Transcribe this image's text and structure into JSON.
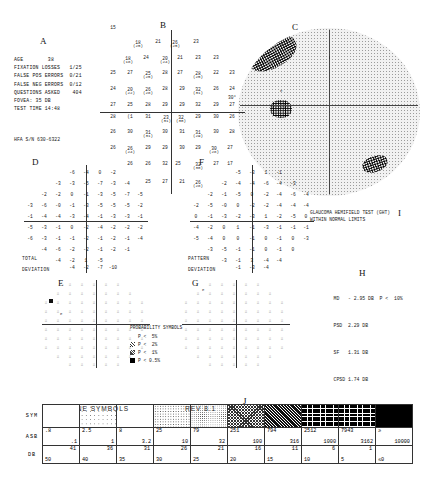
{
  "sections": {
    "A": "A",
    "B": "B",
    "C": "C",
    "D": "D",
    "E": "E",
    "F": "F",
    "G": "G",
    "H": "H",
    "I": "I",
    "J": "J"
  },
  "info": {
    "lines": [
      "AGE        38",
      "FIXATION LOSSES   1/25",
      "FALSE POS ERRORS  0/21",
      "FALSE NEG ERRORS  0/12",
      "QUESTIONS ASKED    404",
      "FOVEA: 35 DB",
      "TEST TIME 14:48"
    ],
    "serial": "HFA S/N  630-6322"
  },
  "raw_sensitivity": {
    "label_deg": "30°",
    "cells": [
      {
        "x": 113,
        "y": 27,
        "v": "15",
        "p": ""
      },
      {
        "x": 138,
        "y": 44,
        "v": "18",
        "p": "(25)"
      },
      {
        "x": 158,
        "y": 41,
        "v": "21",
        "p": ""
      },
      {
        "x": 175,
        "y": 44,
        "v": "26",
        "p": "(25)"
      },
      {
        "x": 196,
        "y": 41,
        "v": "23",
        "p": ""
      },
      {
        "x": 128,
        "y": 60,
        "v": "18",
        "p": "(18)"
      },
      {
        "x": 146,
        "y": 57,
        "v": "24",
        "p": ""
      },
      {
        "x": 165,
        "y": 60,
        "v": "20",
        "p": "(24)"
      },
      {
        "x": 180,
        "y": 57,
        "v": "21",
        "p": ""
      },
      {
        "x": 198,
        "y": 57,
        "v": "23",
        "p": ""
      },
      {
        "x": 216,
        "y": 57,
        "v": "23",
        "p": ""
      },
      {
        "x": 113,
        "y": 72,
        "v": "25",
        "p": ""
      },
      {
        "x": 130,
        "y": 72,
        "v": "27",
        "p": ""
      },
      {
        "x": 148,
        "y": 75,
        "v": "25",
        "p": "(25)"
      },
      {
        "x": 165,
        "y": 72,
        "v": "28",
        "p": ""
      },
      {
        "x": 180,
        "y": 72,
        "v": "27",
        "p": ""
      },
      {
        "x": 198,
        "y": 75,
        "v": "28",
        "p": "(25)"
      },
      {
        "x": 216,
        "y": 72,
        "v": "22",
        "p": ""
      },
      {
        "x": 232,
        "y": 72,
        "v": "23",
        "p": ""
      },
      {
        "x": 113,
        "y": 88,
        "v": "24",
        "p": ""
      },
      {
        "x": 130,
        "y": 91,
        "v": "20",
        "p": "(22)"
      },
      {
        "x": 148,
        "y": 91,
        "v": "26",
        "p": "(28)"
      },
      {
        "x": 165,
        "y": 88,
        "v": "28",
        "p": ""
      },
      {
        "x": 182,
        "y": 88,
        "v": "29",
        "p": ""
      },
      {
        "x": 198,
        "y": 91,
        "v": "32",
        "p": "(31)"
      },
      {
        "x": 216,
        "y": 88,
        "v": "26",
        "p": ""
      },
      {
        "x": 232,
        "y": 88,
        "v": "24",
        "p": ""
      },
      {
        "x": 113,
        "y": 104,
        "v": "27",
        "p": ""
      },
      {
        "x": 130,
        "y": 104,
        "v": "25",
        "p": ""
      },
      {
        "x": 148,
        "y": 104,
        "v": "28",
        "p": ""
      },
      {
        "x": 165,
        "y": 104,
        "v": "29",
        "p": ""
      },
      {
        "x": 182,
        "y": 104,
        "v": "29",
        "p": ""
      },
      {
        "x": 198,
        "y": 104,
        "v": "32",
        "p": ""
      },
      {
        "x": 216,
        "y": 104,
        "v": "29",
        "p": ""
      },
      {
        "x": 232,
        "y": 104,
        "v": "27",
        "p": ""
      },
      {
        "x": 113,
        "y": 116,
        "v": "28",
        "p": ""
      },
      {
        "x": 130,
        "y": 116,
        "v": "(1",
        "p": ""
      },
      {
        "x": 148,
        "y": 116,
        "v": "31",
        "p": ""
      },
      {
        "x": 166,
        "y": 119,
        "v": "23",
        "p": "(31)"
      },
      {
        "x": 181,
        "y": 119,
        "v": "32",
        "p": "(30)"
      },
      {
        "x": 198,
        "y": 116,
        "v": "29",
        "p": ""
      },
      {
        "x": 216,
        "y": 116,
        "v": "30",
        "p": ""
      },
      {
        "x": 232,
        "y": 116,
        "v": "26",
        "p": ""
      },
      {
        "x": 113,
        "y": 131,
        "v": "26",
        "p": ""
      },
      {
        "x": 130,
        "y": 131,
        "v": "30",
        "p": ""
      },
      {
        "x": 148,
        "y": 134,
        "v": "31",
        "p": "(31)"
      },
      {
        "x": 165,
        "y": 131,
        "v": "30",
        "p": ""
      },
      {
        "x": 182,
        "y": 131,
        "v": "31",
        "p": ""
      },
      {
        "x": 198,
        "y": 134,
        "v": "31",
        "p": "(29)"
      },
      {
        "x": 216,
        "y": 131,
        "v": "30",
        "p": ""
      },
      {
        "x": 232,
        "y": 131,
        "v": "28",
        "p": ""
      },
      {
        "x": 113,
        "y": 147,
        "v": "26",
        "p": ""
      },
      {
        "x": 130,
        "y": 150,
        "v": "26",
        "p": "(24)"
      },
      {
        "x": 148,
        "y": 147,
        "v": "29",
        "p": ""
      },
      {
        "x": 165,
        "y": 147,
        "v": "29",
        "p": ""
      },
      {
        "x": 182,
        "y": 147,
        "v": "30",
        "p": ""
      },
      {
        "x": 198,
        "y": 147,
        "v": "29",
        "p": ""
      },
      {
        "x": 214,
        "y": 150,
        "v": "30",
        "p": "(28)"
      },
      {
        "x": 230,
        "y": 147,
        "v": "27",
        "p": ""
      },
      {
        "x": 130,
        "y": 163,
        "v": "26",
        "p": ""
      },
      {
        "x": 148,
        "y": 163,
        "v": "26",
        "p": ""
      },
      {
        "x": 165,
        "y": 163,
        "v": "32",
        "p": ""
      },
      {
        "x": 178,
        "y": 163,
        "v": "25",
        "p": ""
      },
      {
        "x": 198,
        "y": 166,
        "v": "32",
        "p": "(30)"
      },
      {
        "x": 216,
        "y": 163,
        "v": "27",
        "p": ""
      },
      {
        "x": 230,
        "y": 163,
        "v": "17",
        "p": ""
      },
      {
        "x": 148,
        "y": 181,
        "v": "25",
        "p": ""
      },
      {
        "x": 165,
        "y": 181,
        "v": "27",
        "p": ""
      },
      {
        "x": 182,
        "y": 181,
        "v": "21",
        "p": ""
      },
      {
        "x": 198,
        "y": 184,
        "v": "26",
        "p": "(28)"
      }
    ]
  },
  "total_deviation": {
    "title1": "TOTAL",
    "title2": "DEVIATION",
    "rows": [
      {
        "y": 172,
        "xs": [
          72,
          86,
          100,
          113
        ],
        "v": [
          "-6",
          "-4",
          "0",
          "-2"
        ]
      },
      {
        "y": 183,
        "xs": [
          58,
          72,
          86,
          100,
          113,
          127
        ],
        "v": [
          "-3",
          "-3",
          "-5",
          "-7",
          "-3",
          "-4"
        ]
      },
      {
        "y": 194,
        "xs": [
          44,
          58,
          72,
          86,
          100,
          113,
          127,
          140
        ],
        "v": [
          "-2",
          "-2",
          "0",
          "-1",
          "-3",
          "-5",
          "-7",
          "-5"
        ]
      },
      {
        "y": 205,
        "xs": [
          30,
          44,
          58,
          72,
          86,
          100,
          113,
          127,
          140
        ],
        "v": [
          "-3",
          "-6",
          "-0",
          "-1",
          "-3",
          "-5",
          "-5",
          "-5",
          "-2"
        ]
      },
      {
        "y": 216,
        "xs": [
          30,
          44,
          58,
          72,
          86,
          100,
          113,
          127,
          140
        ],
        "v": [
          "-1",
          "-4",
          "-4",
          "-3",
          "-4",
          "-1",
          "-3",
          "-3",
          "-1"
        ]
      },
      {
        "y": 227,
        "xs": [
          30,
          44,
          58,
          72,
          86,
          100,
          113,
          127,
          140
        ],
        "v": [
          "-5",
          "-3",
          "-1",
          "0",
          "-2",
          "-4",
          "-2",
          "-2",
          "-2"
        ]
      },
      {
        "y": 238,
        "xs": [
          30,
          44,
          58,
          72,
          86,
          100,
          113,
          127,
          140
        ],
        "v": [
          "-6",
          "-3",
          "-1",
          "-1",
          "-2",
          "-1",
          "-2",
          "-1",
          "-4"
        ]
      },
      {
        "y": 249,
        "xs": [
          44,
          58,
          72,
          86,
          100,
          113,
          127
        ],
        "v": [
          "-4",
          "-6",
          "-2",
          "-2",
          "-1",
          "-2",
          "-1"
        ]
      },
      {
        "y": 260,
        "xs": [
          58,
          72,
          86,
          100
        ],
        "v": [
          "-4",
          "-2",
          "1",
          "-5"
        ]
      },
      {
        "y": 267,
        "xs": [
          72,
          86,
          100,
          113
        ],
        "v": [
          "-4",
          "-2",
          "-7",
          "-10"
        ]
      }
    ]
  },
  "pattern_deviation": {
    "title1": "PATTERN",
    "title2": "DEVIATION",
    "rows": [
      {
        "y": 172,
        "xs": [
          238,
          252,
          266,
          279
        ],
        "v": [
          "-5",
          "-3",
          "1",
          "-1"
        ]
      },
      {
        "y": 183,
        "xs": [
          224,
          238,
          252,
          266,
          279,
          293
        ],
        "v": [
          "-2",
          "-4",
          "-4",
          "-6",
          "-4",
          "-3"
        ]
      },
      {
        "y": 194,
        "xs": [
          210,
          224,
          238,
          252,
          266,
          279,
          293,
          306
        ],
        "v": [
          "-2",
          "-1",
          "-5",
          "0",
          "-2",
          "-4",
          "-6",
          "-4"
        ]
      },
      {
        "y": 205,
        "xs": [
          196,
          210,
          224,
          238,
          252,
          266,
          279,
          293,
          306
        ],
        "v": [
          "-2",
          "-5",
          "-0",
          "0",
          "-2",
          "-2",
          "-4",
          "-4",
          "-4"
        ]
      },
      {
        "y": 216,
        "xs": [
          196,
          210,
          224,
          238,
          252,
          266,
          279,
          293,
          306
        ],
        "v": [
          "0",
          "-1",
          "-3",
          "-2",
          "-3",
          "1",
          "-2",
          "-5",
          "0"
        ]
      },
      {
        "y": 227,
        "xs": [
          196,
          210,
          224,
          238,
          252,
          266,
          279,
          293,
          306
        ],
        "v": [
          "-4",
          "-2",
          "0",
          "1",
          "-1",
          "-3",
          "-1",
          "-1",
          "-1"
        ]
      },
      {
        "y": 238,
        "xs": [
          196,
          210,
          224,
          238,
          252,
          266,
          279,
          293,
          306
        ],
        "v": [
          "-5",
          "-4",
          "0",
          "0",
          "-1",
          "0",
          "-1",
          "0",
          "-3"
        ]
      },
      {
        "y": 249,
        "xs": [
          210,
          224,
          238,
          252,
          266,
          279,
          293
        ],
        "v": [
          "-3",
          "-5",
          "-1",
          "-1",
          "0",
          "-1",
          "0"
        ]
      },
      {
        "y": 260,
        "xs": [
          224,
          238,
          252,
          266,
          279
        ],
        "v": [
          "-3",
          "-1",
          "3",
          "-4",
          "-4"
        ]
      },
      {
        "y": 267,
        "xs": [
          238,
          252,
          266
        ],
        "v": [
          "-1",
          "-3",
          "-4"
        ]
      }
    ]
  },
  "probability_legend": {
    "title": "PROBABILITY SYMBOLS",
    "entries": [
      "P <  5%",
      "P <  2%",
      "P <  1%",
      "P < 0.5%"
    ]
  },
  "ght": {
    "line1": "GLAUCOMA HEMIFIELD TEST (GHT)",
    "line2": "WITHIN NORMAL LIMITS"
  },
  "global_indices": [
    {
      "name": "MD",
      "value": "- 2.95 DB",
      "prob": "P <  10%"
    },
    {
      "name": "PSD",
      "value": "2.29 DB",
      "prob": ""
    },
    {
      "name": "SF",
      "value": "1.31 DB",
      "prob": ""
    },
    {
      "name": "CPSD",
      "value": "1.74 DB",
      "prob": ""
    }
  ],
  "greytone_table": {
    "title": "GRAYTONE SYMBOLS",
    "revision": "REV 8.1",
    "row_labels": {
      "sym": "SYM",
      "asb": "ASB",
      "db": "DB"
    },
    "columns": [
      {
        "sym": "sw0",
        "asb_hi": ".8",
        "asb_lo": ".1",
        "db_hi": "41",
        "db_lo": "50"
      },
      {
        "sym": "sw1",
        "asb_hi": "2.5",
        "asb_lo": "1",
        "db_hi": "36",
        "db_lo": "40"
      },
      {
        "sym": "sw2",
        "asb_hi": "8",
        "asb_lo": "3.2",
        "db_hi": "31",
        "db_lo": "35"
      },
      {
        "sym": "sw3",
        "asb_hi": "25",
        "asb_lo": "10",
        "db_hi": "26",
        "db_lo": "30"
      },
      {
        "sym": "sw4",
        "asb_hi": "79",
        "asb_lo": "32",
        "db_hi": "21",
        "db_lo": "25"
      },
      {
        "sym": "sw5",
        "asb_hi": "251",
        "asb_lo": "100",
        "db_hi": "16",
        "db_lo": "20"
      },
      {
        "sym": "sw6",
        "asb_hi": "794",
        "asb_lo": "316",
        "db_hi": "11",
        "db_lo": "15"
      },
      {
        "sym": "sw7",
        "asb_hi": "2512",
        "asb_lo": "1000",
        "db_hi": "6",
        "db_lo": "10"
      },
      {
        "sym": "sw7",
        "asb_hi": "7943",
        "asb_lo": "3162",
        "db_hi": "1",
        "db_lo": "5"
      },
      {
        "sym": "sw8",
        "asb_hi": "≥",
        "asb_lo": "10000",
        "db_hi": "",
        "db_lo": "≤0"
      }
    ]
  }
}
